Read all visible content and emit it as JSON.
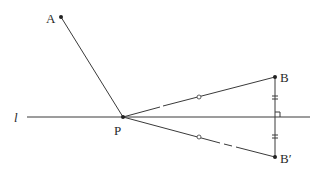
{
  "diagram": {
    "type": "geometry-reflection",
    "line_label": "l",
    "points": {
      "A": {
        "label": "A",
        "x": 61,
        "y": 17
      },
      "P": {
        "label": "P",
        "x": 123,
        "y": 117
      },
      "B": {
        "label": "B",
        "x": 275,
        "y": 77
      },
      "B_prime": {
        "label": "B′",
        "x": 275,
        "y": 157
      }
    },
    "line_l": {
      "x1": 27,
      "y1": 117,
      "x2": 310,
      "y2": 117
    },
    "marks": {
      "equal_segment_circles": "PB = PB′",
      "double_ticks": "B to l = B′ to l",
      "right_angle": "BB′ ⊥ l"
    }
  }
}
